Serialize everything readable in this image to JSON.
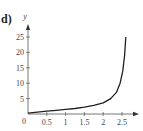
{
  "panel_label": "d)",
  "chart_data": {
    "type": "line",
    "title": "",
    "xlabel": "",
    "ylabel": "y",
    "xlim": [
      0,
      2.8
    ],
    "ylim": [
      0,
      27
    ],
    "x_ticks": [
      "0.5",
      "1",
      "1.5",
      "2",
      "2.5"
    ],
    "y_ticks": [
      "5",
      "10",
      "15",
      "20",
      "25"
    ],
    "origin_label": "0",
    "grid": false,
    "legend": null,
    "series": [
      {
        "name": "curve",
        "x": [
          0,
          0.25,
          0.5,
          0.75,
          1.0,
          1.25,
          1.5,
          1.75,
          2.0,
          2.2,
          2.35,
          2.45,
          2.52,
          2.57,
          2.6
        ],
        "y": [
          0.3,
          0.6,
          0.9,
          1.2,
          1.5,
          1.8,
          2.2,
          2.8,
          3.6,
          5.0,
          7.0,
          10.0,
          14.0,
          19.0,
          25.0
        ]
      }
    ]
  }
}
